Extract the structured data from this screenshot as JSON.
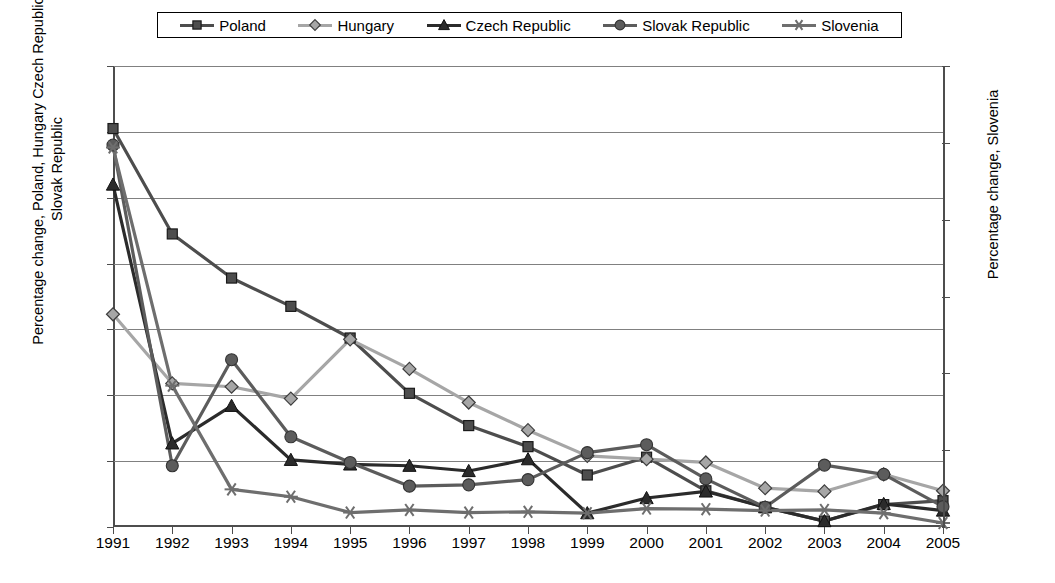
{
  "chart_data": {
    "type": "line",
    "title": "",
    "xlabel": "",
    "ylabel": "Percentage change, Poland, Hungary Czech Republic, Slovak Republic",
    "ylabel_right": "Percentage change, Slovenia",
    "categories": [
      "1991",
      "1992",
      "1993",
      "1994",
      "1995",
      "1996",
      "1997",
      "1998",
      "1999",
      "2000",
      "2001",
      "2002",
      "2003",
      "2004",
      "2005"
    ],
    "ylim": [
      0,
      70
    ],
    "yticks": [
      0,
      10,
      20,
      30,
      40,
      50,
      60,
      70
    ],
    "ylim_right": [
      0,
      300
    ],
    "yticks_right": [
      0,
      50,
      100,
      150,
      200,
      250,
      300
    ],
    "grid": true,
    "legend_position": "top",
    "series": [
      {
        "name": "Poland",
        "axis": "left",
        "marker": "square",
        "color": "#4d4d4d",
        "values": [
          60.5,
          44.5,
          37.8,
          33.5,
          28.7,
          20.3,
          15.4,
          12.2,
          7.9,
          10.6,
          5.5,
          3.0,
          0.9,
          3.4,
          4.0
        ]
      },
      {
        "name": "Hungary",
        "axis": "left",
        "marker": "diamond",
        "color": "#a6a6a6",
        "values": [
          32.3,
          21.8,
          21.3,
          19.5,
          28.5,
          24.0,
          18.9,
          14.7,
          10.8,
          10.3,
          9.8,
          5.9,
          5.4,
          8.0,
          5.5
        ]
      },
      {
        "name": "Czech Republic",
        "axis": "left",
        "marker": "triangle",
        "color": "#2b2b2b",
        "values": [
          52.0,
          12.7,
          18.4,
          10.2,
          9.5,
          9.3,
          8.5,
          10.3,
          2.1,
          4.4,
          5.4,
          3.0,
          0.9,
          3.5,
          2.5
        ]
      },
      {
        "name": "Slovak Republic",
        "axis": "left",
        "marker": "circle",
        "color": "#5c5c5c",
        "values": [
          58.0,
          9.3,
          25.4,
          13.7,
          9.8,
          6.2,
          6.4,
          7.2,
          11.3,
          12.5,
          7.3,
          3.0,
          9.4,
          8.0,
          3.1
        ]
      },
      {
        "name": "Slovenia",
        "axis": "right",
        "marker": "asterisk",
        "color": "#6e6e6e",
        "values_right": [
          247,
          92,
          24.5,
          19.7,
          9.4,
          11.1,
          9.4,
          9.9,
          9.0,
          12.0,
          11.6,
          10.7,
          11.1,
          9.0,
          2.6
        ]
      }
    ]
  },
  "legend": {
    "items": [
      {
        "label": "Poland",
        "marker": "square"
      },
      {
        "label": "Hungary",
        "marker": "diamond"
      },
      {
        "label": "Czech Republic",
        "marker": "triangle"
      },
      {
        "label": "Slovak Republic",
        "marker": "circle"
      },
      {
        "label": "Slovenia",
        "marker": "asterisk"
      }
    ]
  },
  "colors": {
    "poland": "#4d4d4d",
    "hungary": "#a6a6a6",
    "czech": "#2b2b2b",
    "slovak": "#5c5c5c",
    "slovenia": "#6e6e6e",
    "grid": "#808080",
    "axis": "#4d4d4d",
    "background": "#ffffff"
  }
}
